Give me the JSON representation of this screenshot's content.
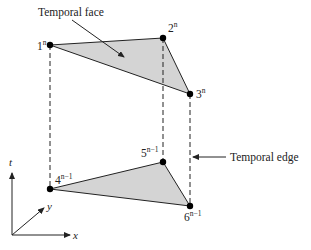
{
  "diagram": {
    "colors": {
      "face_fill": "#d4d4d4",
      "stroke": "#222222",
      "point": "#000000"
    },
    "annotations": {
      "temporal_face": "Temporal face",
      "temporal_edge": "Temporal edge"
    },
    "nodes": [
      {
        "id": "1",
        "label": "1",
        "superscript": "n",
        "x": 50,
        "y": 45
      },
      {
        "id": "2",
        "label": "2",
        "superscript": "n",
        "x": 163,
        "y": 38
      },
      {
        "id": "3",
        "label": "3",
        "superscript": "n",
        "x": 190,
        "y": 94
      },
      {
        "id": "4",
        "label": "4",
        "superscript": "n−1",
        "x": 50,
        "y": 189
      },
      {
        "id": "5",
        "label": "5",
        "superscript": "n−1",
        "x": 163,
        "y": 162
      },
      {
        "id": "6",
        "label": "6",
        "superscript": "n−1",
        "x": 190,
        "y": 206
      }
    ],
    "faces": [
      {
        "name": "top-triangle",
        "nodes": [
          "1",
          "2",
          "3"
        ]
      },
      {
        "name": "bottom-triangle",
        "nodes": [
          "4",
          "5",
          "6"
        ]
      }
    ],
    "temporal_edges": [
      [
        "1",
        "4"
      ],
      [
        "2",
        "5"
      ],
      [
        "3",
        "6"
      ]
    ],
    "axes": {
      "t": "t",
      "x": "x",
      "y": "y"
    }
  }
}
